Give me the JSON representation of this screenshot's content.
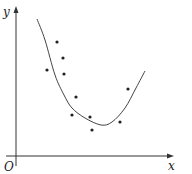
{
  "labels": {
    "x_axis": "x",
    "y_axis": "y",
    "origin": "O"
  },
  "colors": {
    "ink": "#333333",
    "background": "#ffffff"
  },
  "chart_data": {
    "type": "scatter",
    "title": "",
    "xlabel": "x",
    "ylabel": "y",
    "grid": false,
    "legend": "none",
    "annotations": [
      "O"
    ],
    "points": [
      {
        "x": 57,
        "y": 42
      },
      {
        "x": 63,
        "y": 58
      },
      {
        "x": 47,
        "y": 70
      },
      {
        "x": 64,
        "y": 74
      },
      {
        "x": 76,
        "y": 97
      },
      {
        "x": 72,
        "y": 115
      },
      {
        "x": 90,
        "y": 117
      },
      {
        "x": 92,
        "y": 130
      },
      {
        "x": 120,
        "y": 122
      },
      {
        "x": 128,
        "y": 89
      }
    ],
    "fit_curve": {
      "type": "line",
      "description": "U-shaped fitted curve through scatter points",
      "path": [
        [
          37,
          19
        ],
        [
          45,
          40
        ],
        [
          55,
          75
        ],
        [
          64,
          95
        ],
        [
          72,
          108
        ],
        [
          85,
          118
        ],
        [
          101,
          125
        ],
        [
          112,
          122
        ],
        [
          125,
          108
        ],
        [
          136,
          88
        ],
        [
          145,
          71
        ]
      ]
    }
  }
}
